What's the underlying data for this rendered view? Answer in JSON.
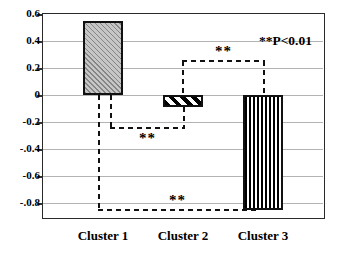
{
  "chart_data": {
    "type": "bar",
    "title": "",
    "xlabel": "",
    "ylabel": "",
    "categories": [
      "Cluster 1",
      "Cluster 2",
      "Cluster 3"
    ],
    "values": [
      0.55,
      -0.09,
      -0.85
    ],
    "ylim": [
      -0.9,
      0.6
    ],
    "grid": true,
    "legend": "none",
    "yticks": [
      {
        "value": 0.6,
        "label": "0.6"
      },
      {
        "value": 0.4,
        "label": "0.4"
      },
      {
        "value": 0.2,
        "label": "0.2"
      },
      {
        "value": 0.0,
        "label": "0"
      },
      {
        "value": -0.2,
        "label": "-0.2"
      },
      {
        "value": -0.4,
        "label": "-.0.4"
      },
      {
        "value": -0.6,
        "label": "-0.6"
      },
      {
        "value": -0.8,
        "label": "-.0.8"
      }
    ],
    "bar_patterns": [
      "fine-diagonal-hatch",
      "thick-diagonal-stripes",
      "vertical-stripes"
    ],
    "significance_note": "**P<0.01",
    "annotations": [
      {
        "label": "**",
        "from": 0,
        "to": 1,
        "level": -0.24,
        "side": "below",
        "label_position": "below-line"
      },
      {
        "label": "**",
        "from": 1,
        "to": 2,
        "level": 0.25,
        "side": "above",
        "label_position": "above-line"
      },
      {
        "label": "**",
        "from": 0,
        "to": 2,
        "level": -0.85,
        "side": "below",
        "label_position": "above-line"
      }
    ],
    "colors": {
      "background": "#ffffff",
      "frame": "#2a2a2a",
      "gridline": "#b3b3b3",
      "bar_border": "#111111",
      "dash_lines": "#111111",
      "text": "#000000"
    }
  }
}
